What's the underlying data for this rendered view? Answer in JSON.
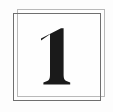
{
  "card": {
    "numeral": "1",
    "numeral_icon": "digit-one-serif-glyph",
    "background_color": "#fdfdfd",
    "plate_color": "#fefefe",
    "numeral_color": "#1a1a1a",
    "frames": [
      {
        "name": "outer-frame-light",
        "border_color": "#b9b9b9",
        "offset": "up-right"
      },
      {
        "name": "outer-frame-dark",
        "border_color": "#6f6f6f",
        "offset": "down-left"
      }
    ]
  }
}
